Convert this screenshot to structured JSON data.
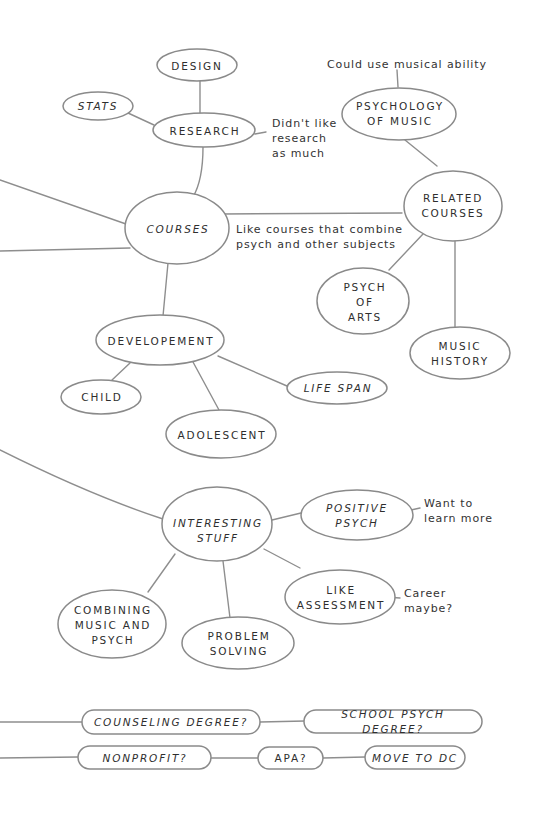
{
  "diagram": {
    "type": "mind-map",
    "colors": {
      "stroke": "#8a8a8a",
      "text": "#2e2e2e",
      "background": "#ffffff"
    },
    "nodes": {
      "design": {
        "label": "DESIGN"
      },
      "stats": {
        "label": "STATS"
      },
      "research": {
        "label": "RESEARCH"
      },
      "courses": {
        "label": "COURSES"
      },
      "psych_music": {
        "label": "PSYCHOLOGY\nOF MUSIC"
      },
      "related_courses": {
        "label": "RELATED\nCOURSES"
      },
      "psych_arts": {
        "label": "PSYCH\nOF\nARTS"
      },
      "music_history": {
        "label": "MUSIC\nHISTORY"
      },
      "development": {
        "label": "DEVELOPEMENT"
      },
      "child": {
        "label": "CHILD"
      },
      "adolescent": {
        "label": "ADOLESCENT"
      },
      "life_span": {
        "label": "LIFE SPAN"
      },
      "interesting_stuff": {
        "label": "INTERESTING\nSTUFF"
      },
      "positive_psych": {
        "label": "POSITIVE\nPSYCH"
      },
      "like_assessment": {
        "label": "LIKE\nASSESSMENT"
      },
      "combining_music_psych": {
        "label": "COMBINING\nMUSIC AND\nPSYCH"
      },
      "problem_solving": {
        "label": "PROBLEM\nSOLVING"
      },
      "counseling_degree": {
        "label": "COUNSELING DEGREE?"
      },
      "school_psych_degree": {
        "label": "SCHOOL PSYCH DEGREE?"
      },
      "nonprofit": {
        "label": "NONPROFIT?"
      },
      "apa": {
        "label": "APA?"
      },
      "move_to_dc": {
        "label": "MOVE TO DC"
      }
    },
    "notes": {
      "musical_ability": "Could use musical ability",
      "research_dislike": "Didn't like\nresearch\nas much",
      "combine_courses": "Like courses that combine\npsych and other subjects",
      "learn_more": "Want to\nlearn more",
      "career_maybe": "Career\nmaybe?"
    },
    "edges": [
      [
        "design",
        "research"
      ],
      [
        "stats",
        "research"
      ],
      [
        "research",
        "research_dislike"
      ],
      [
        "research",
        "courses"
      ],
      [
        "courses",
        "related_courses"
      ],
      [
        "psych_music",
        "musical_ability"
      ],
      [
        "psych_music",
        "related_courses"
      ],
      [
        "related_courses",
        "psych_arts"
      ],
      [
        "related_courses",
        "music_history"
      ],
      [
        "courses",
        "development"
      ],
      [
        "development",
        "child"
      ],
      [
        "development",
        "adolescent"
      ],
      [
        "development",
        "life_span"
      ],
      [
        "interesting_stuff",
        "positive_psych"
      ],
      [
        "positive_psych",
        "learn_more"
      ],
      [
        "interesting_stuff",
        "like_assessment"
      ],
      [
        "like_assessment",
        "career_maybe"
      ],
      [
        "interesting_stuff",
        "combining_music_psych"
      ],
      [
        "interesting_stuff",
        "problem_solving"
      ],
      [
        "counseling_degree",
        "school_psych_degree"
      ],
      [
        "nonprofit",
        "apa"
      ],
      [
        "apa",
        "move_to_dc"
      ]
    ]
  }
}
